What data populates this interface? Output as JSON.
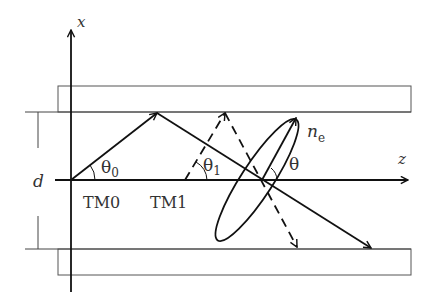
{
  "diagram": {
    "title": "",
    "labels": {
      "x_axis": "x",
      "z_axis": "z",
      "thickness": "d",
      "mode0": "TM0",
      "mode1": "TM1",
      "theta0": "θ",
      "theta0_sub": "0",
      "theta1": "θ",
      "theta1_sub": "1",
      "theta": "θ",
      "index_main": "n",
      "index_sub": "e"
    },
    "colors": {
      "stroke": "#111111",
      "plate_stroke": "#555555",
      "text": "#333333"
    },
    "elements": [
      {
        "id": "top-cladding",
        "type": "rect"
      },
      {
        "id": "bottom-cladding",
        "type": "rect"
      },
      {
        "id": "x-axis",
        "type": "arrow"
      },
      {
        "id": "z-axis",
        "type": "arrow"
      },
      {
        "id": "tm0-ray",
        "type": "solid-arrow-path"
      },
      {
        "id": "tm1-ray",
        "type": "dashed-arrow-path"
      },
      {
        "id": "index-ellipse",
        "type": "ellipse"
      },
      {
        "id": "thickness-marker",
        "type": "dimension"
      }
    ]
  }
}
